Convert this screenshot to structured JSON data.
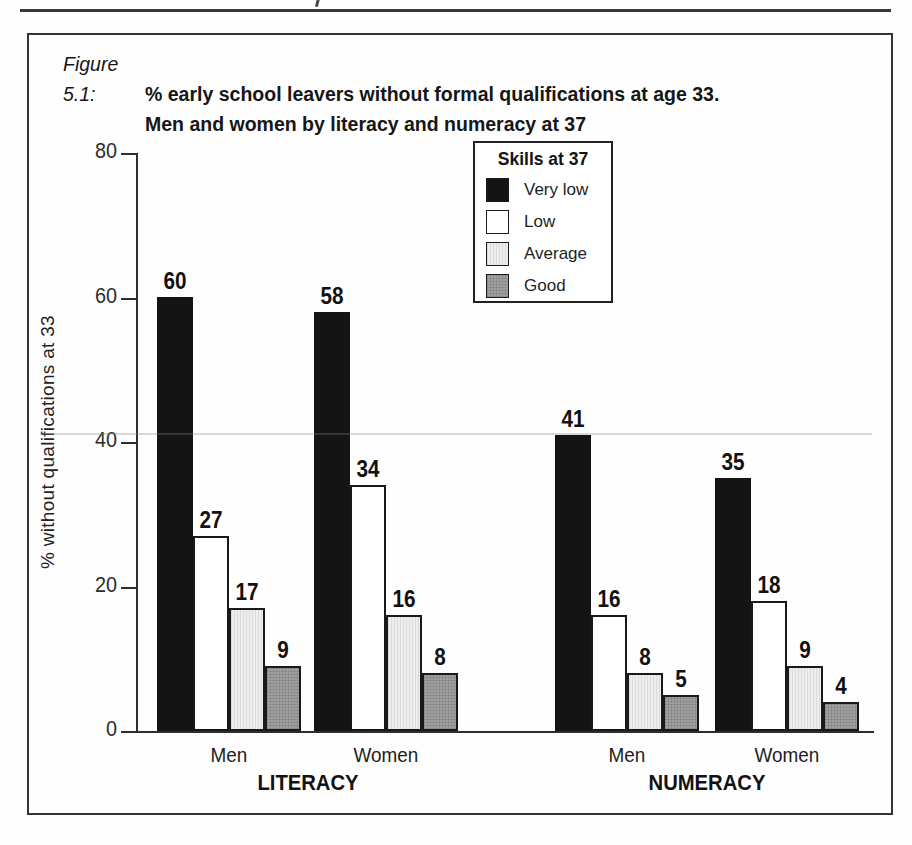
{
  "figure": {
    "label": "Figure 5.1:",
    "title_line1": "% early school leavers without formal qualifications at age 33.",
    "title_line2": "Men and women by literacy and numeracy at 37"
  },
  "chart_data": {
    "type": "bar",
    "ylabel": "% without qualifications at 33",
    "xlabel": "",
    "ylim": [
      0,
      80
    ],
    "yticks": [
      0,
      20,
      40,
      60,
      80
    ],
    "grid": false,
    "legend_title": "Skills at 37",
    "legend_position": "top-center-inside",
    "group_labels": [
      "LITERACY",
      "NUMERACY"
    ],
    "categories": [
      "Men",
      "Women",
      "Men",
      "Women"
    ],
    "category_keys": [
      "literacy-men",
      "literacy-women",
      "numeracy-men",
      "numeracy-women"
    ],
    "series": [
      {
        "name": "Very low",
        "color": "#141414",
        "values": [
          60,
          58,
          41,
          35
        ]
      },
      {
        "name": "Low",
        "color": "#ffffff",
        "values": [
          27,
          34,
          16,
          18
        ]
      },
      {
        "name": "Average",
        "color": "#ededed",
        "values": [
          17,
          16,
          8,
          9
        ]
      },
      {
        "name": "Good",
        "color": "#a0a0a0",
        "values": [
          9,
          8,
          5,
          4
        ]
      }
    ]
  }
}
